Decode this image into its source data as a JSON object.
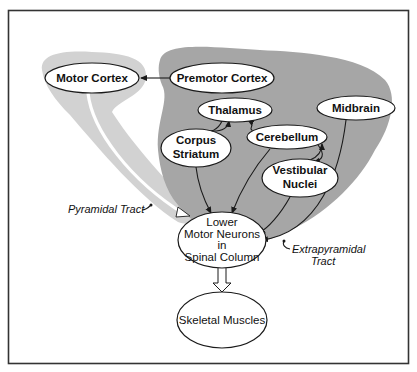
{
  "diagram": {
    "title": "",
    "colors": {
      "background": "#ffffff",
      "frame": "#333333",
      "pyramidal_region": "#d2d2d2",
      "extrapyramidal_region": "#a6a6a6",
      "node_fill": "#ffffff",
      "stroke": "#1a1a1a"
    },
    "nodes": {
      "motor_cortex": {
        "label": "Motor Cortex"
      },
      "premotor_cortex": {
        "label": "Premotor Cortex"
      },
      "thalamus": {
        "label": "Thalamus"
      },
      "corpus_striatum": {
        "line1": "Corpus",
        "line2": "Striatum"
      },
      "cerebellum": {
        "label": "Cerebellum"
      },
      "midbrain": {
        "label": "Midbrain"
      },
      "vestibular_nuclei": {
        "line1": "Vestibular",
        "line2": "Nuclei"
      },
      "lower_motor_neurons": {
        "line1": "Lower",
        "line2": "Motor Neurons",
        "line3": "in",
        "line4": "Spinal Column"
      },
      "skeletal_muscles": {
        "label": "Skeletal Muscles"
      }
    },
    "tracts": {
      "pyramidal": {
        "label": "Pyramidal Tract"
      },
      "extrapyramidal": {
        "line1": "Extrapyramidal",
        "line2": "Tract"
      }
    },
    "edges": [
      {
        "from": "Premotor Cortex",
        "to": "Motor Cortex"
      },
      {
        "from": "Motor Cortex",
        "to": "Lower Motor Neurons in Spinal Column",
        "style": "double-line (pyramidal)"
      },
      {
        "from": "Thalamus",
        "to": "Corpus Striatum"
      },
      {
        "from": "Corpus Striatum",
        "to": "Thalamus"
      },
      {
        "from": "Cerebellum",
        "to": "Thalamus"
      },
      {
        "from": "Cerebellum",
        "to": "Vestibular Nuclei"
      },
      {
        "from": "Vestibular Nuclei",
        "to": "Cerebellum"
      },
      {
        "from": "Corpus Striatum",
        "to": "Lower Motor Neurons in Spinal Column"
      },
      {
        "from": "Cerebellum",
        "to": "Lower Motor Neurons in Spinal Column"
      },
      {
        "from": "Vestibular Nuclei",
        "to": "Lower Motor Neurons in Spinal Column"
      },
      {
        "from": "Midbrain",
        "to": "Lower Motor Neurons in Spinal Column"
      },
      {
        "from": "Lower Motor Neurons in Spinal Column",
        "to": "Skeletal Muscles",
        "style": "hollow double arrow"
      }
    ]
  }
}
